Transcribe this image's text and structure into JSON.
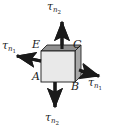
{
  "figure": {
    "type": "mechanics-stress-element-diagram",
    "background_color": "#ffffff",
    "stroke_color": "#1a1a1a",
    "face_fill": "#e8e8e8",
    "edge_fill": "#a8a8a8",
    "top_edge_fill": "#8f8f8f"
  },
  "face_labels": [
    {
      "id": "label-E",
      "text": "E",
      "x": 32,
      "y": 39
    },
    {
      "id": "label-C",
      "text": "C",
      "x": 73,
      "y": 39
    },
    {
      "id": "label-A",
      "text": "A",
      "x": 32,
      "y": 71
    },
    {
      "id": "label-B",
      "text": "B",
      "x": 71,
      "y": 81
    }
  ],
  "stress_vectors": [
    {
      "id": "tau-n2-top",
      "symbol": "τ",
      "subscript": "n",
      "subsubscript": "2",
      "direction": "up",
      "label_x": 47,
      "label_y": 1
    },
    {
      "id": "tau-n1-left",
      "symbol": "τ",
      "subscript": "n",
      "subsubscript": "1",
      "direction": "up-left",
      "label_x": 2,
      "label_y": 40
    },
    {
      "id": "tau-n1-right",
      "symbol": "τ",
      "subscript": "n",
      "subsubscript": "1",
      "direction": "down-right",
      "label_x": 88,
      "label_y": 77
    },
    {
      "id": "tau-n2-bottom",
      "symbol": "τ",
      "subscript": "n",
      "subsubscript": "2",
      "direction": "down",
      "label_x": 45,
      "label_y": 112
    }
  ]
}
